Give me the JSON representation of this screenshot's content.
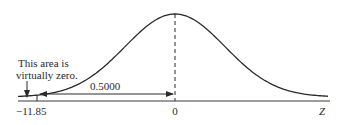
{
  "diagram": {
    "type": "normal-distribution-curve",
    "annotation": {
      "line1": "This area is",
      "line2": "virtually zero."
    },
    "area_label": "0.5000",
    "axis": {
      "left_tick_label": "−11.85",
      "center_tick_label": "0",
      "axis_label": "Z"
    },
    "colors": {
      "stroke": "#2a2a2a",
      "background": "#ffffff"
    }
  }
}
